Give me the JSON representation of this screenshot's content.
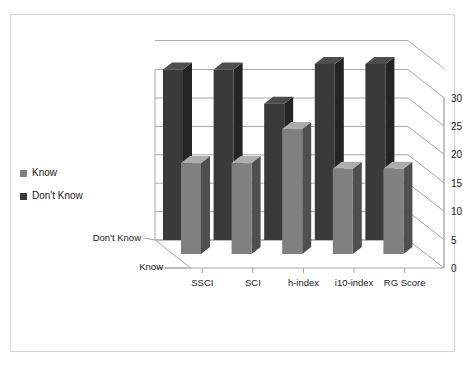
{
  "chart_data": {
    "type": "bar",
    "title": "",
    "subtitle": "",
    "xlabel": "",
    "ylabel": "",
    "categories": [
      "SSCI",
      "SCI",
      "h-index",
      "i10-index",
      "RG Score"
    ],
    "series": [
      {
        "name": "Don't Know",
        "values": [
          30,
          30,
          24,
          31,
          31
        ],
        "color": "#3a3a3a"
      },
      {
        "name": "Know",
        "values": [
          16,
          16,
          22,
          15,
          15
        ],
        "color": "#808080"
      }
    ],
    "depth_axis_labels": [
      "Don't Know",
      "Know"
    ],
    "ylim": [
      0,
      30
    ],
    "yticks": [
      0,
      5,
      10,
      15,
      20,
      25,
      30
    ],
    "ytick_labels": [
      "0",
      "5",
      "10",
      "15",
      "20",
      "25",
      "30"
    ],
    "grid": true,
    "legend_position": "left",
    "legend_entries": [
      {
        "label": "Know",
        "color": "#808080"
      },
      {
        "label": "Don't Know",
        "color": "#3a3a3a"
      }
    ],
    "three_d": true,
    "frame_color": "#d3d3d3",
    "gridline_color": "#a6a6a6",
    "axis_color": "#a6a6a6",
    "background": "#ffffff"
  }
}
